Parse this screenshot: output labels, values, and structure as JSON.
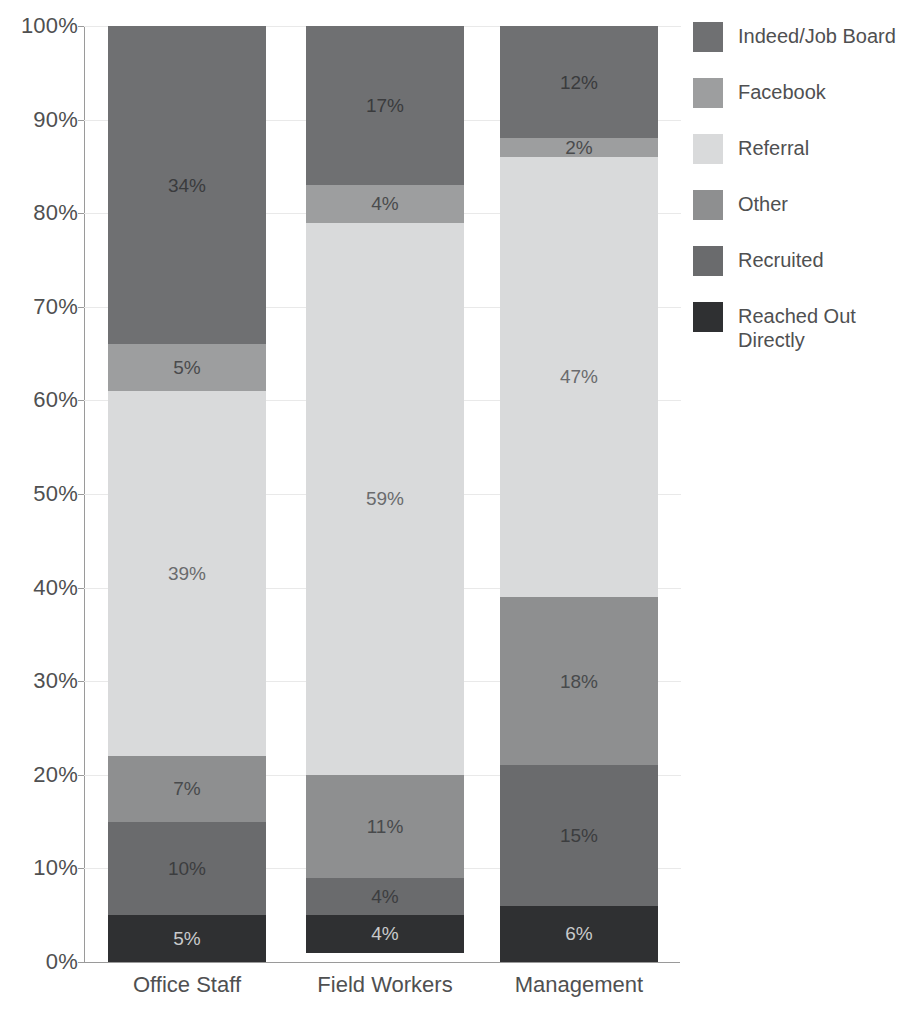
{
  "chart_data": {
    "type": "bar",
    "subtype": "stacked-100-percent",
    "title": "",
    "xlabel": "",
    "ylabel": "",
    "ylim": [
      0,
      100
    ],
    "grid": true,
    "legend_position": "right",
    "categories": [
      "Office Staff",
      "Field Workers",
      "Management"
    ],
    "ytick_labels": [
      "0%",
      "10%",
      "20%",
      "30%",
      "40%",
      "50%",
      "60%",
      "70%",
      "80%",
      "90%",
      "100%"
    ],
    "ytick_values": [
      0,
      10,
      20,
      30,
      40,
      50,
      60,
      70,
      80,
      90,
      100
    ],
    "series": [
      {
        "name": "Indeed/Job Board",
        "color": "#6f7072",
        "label_color": "#3a3b3d",
        "values": [
          34,
          17,
          12
        ],
        "labels": [
          "34%",
          "17%",
          "12%"
        ]
      },
      {
        "name": "Facebook",
        "color": "#9d9e9f",
        "label_color": "#4a4b4d",
        "values": [
          5,
          4,
          2
        ],
        "labels": [
          "5%",
          "4%",
          "2%"
        ]
      },
      {
        "name": "Referral",
        "color": "#d9dadb",
        "label_color": "#6a6b6d",
        "values": [
          39,
          59,
          47
        ],
        "labels": [
          "39%",
          "59%",
          "47%"
        ]
      },
      {
        "name": "Other",
        "color": "#8e8f90",
        "label_color": "#484a4c",
        "values": [
          7,
          11,
          18
        ],
        "labels": [
          "7%",
          "11%",
          "18%"
        ]
      },
      {
        "name": "Recruited",
        "color": "#6a6b6d",
        "label_color": "#3c3d3f",
        "values": [
          10,
          4,
          15
        ],
        "labels": [
          "10%",
          "4%",
          "15%"
        ]
      },
      {
        "name": "Reached Out Directly",
        "legend_label": "Reached Out\nDirectly",
        "color": "#2f3032",
        "label_color": "#c9cacb",
        "values": [
          5,
          4,
          6
        ],
        "labels": [
          "5%",
          "4%",
          "6%"
        ]
      }
    ]
  },
  "axis": {
    "y": {
      "t0": "0%",
      "t1": "10%",
      "t2": "20%",
      "t3": "30%",
      "t4": "40%",
      "t5": "50%",
      "t6": "60%",
      "t7": "70%",
      "t8": "80%",
      "t9": "90%",
      "t10": "100%"
    },
    "x": {
      "c0": "Office Staff",
      "c1": "Field Workers",
      "c2": "Management"
    }
  },
  "legend": {
    "items": [
      {
        "label": "Indeed/Job Board",
        "color": "#6f7072"
      },
      {
        "label": "Facebook",
        "color": "#9d9e9f"
      },
      {
        "label": "Referral",
        "color": "#d9dadb"
      },
      {
        "label": "Other",
        "color": "#8e8f90"
      },
      {
        "label": "Recruited",
        "color": "#6a6b6d"
      },
      {
        "label": "Reached Out\nDirectly",
        "color": "#2f3032"
      }
    ]
  },
  "colors": {
    "background": "#ffffff",
    "axis_line": "#9a9a9a",
    "gridline": "#e9e9e9",
    "tick_text": "#4f5051"
  }
}
